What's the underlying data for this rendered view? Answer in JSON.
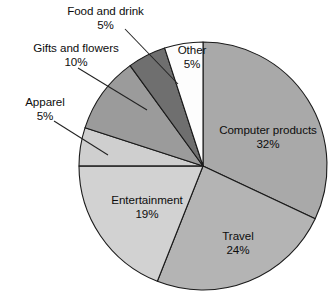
{
  "chart_data": {
    "type": "pie",
    "title": "",
    "subtitle": "",
    "xlabel": "",
    "ylabel": "",
    "legend_position": "none",
    "grid": false,
    "unit": "%",
    "start_angle_deg": 0,
    "direction": "clockwise",
    "categories": [
      "Computer products",
      "Travel",
      "Entertainment",
      "Apparel",
      "Gifts and flowers",
      "Food and drink",
      "Other"
    ],
    "values": [
      32,
      24,
      19,
      5,
      10,
      5,
      5
    ],
    "slices": [
      {
        "label": "Computer products",
        "value": 32,
        "percent_text": "32%",
        "color": "#a9a9a9",
        "start_deg": 0,
        "end_deg": 115.2,
        "label_placement": "inside"
      },
      {
        "label": "Travel",
        "value": 24,
        "percent_text": "24%",
        "color": "#b4b4b4",
        "start_deg": 115.2,
        "end_deg": 201.6,
        "label_placement": "inside"
      },
      {
        "label": "Entertainment",
        "value": 19,
        "percent_text": "19%",
        "color": "#d2d2d2",
        "start_deg": 201.6,
        "end_deg": 270.0,
        "label_placement": "inside"
      },
      {
        "label": "Apparel",
        "value": 5,
        "percent_text": "5%",
        "color": "#cfcfcf",
        "start_deg": 270.0,
        "end_deg": 288.0,
        "label_placement": "callout"
      },
      {
        "label": "Gifts and flowers",
        "value": 10,
        "percent_text": "10%",
        "color": "#9b9b9b",
        "start_deg": 288.0,
        "end_deg": 324.0,
        "label_placement": "callout"
      },
      {
        "label": "Food and drink",
        "value": 5,
        "percent_text": "5%",
        "color": "#6f6f6f",
        "start_deg": 324.0,
        "end_deg": 342.0,
        "label_placement": "callout"
      },
      {
        "label": "Other",
        "value": 5,
        "percent_text": "5%",
        "color": "#fdfdfd",
        "start_deg": 342.0,
        "end_deg": 360.0,
        "label_placement": "inside"
      }
    ],
    "colors": {
      "outline": "#1a1a1a",
      "leader_line": "#222222",
      "text": "#0d0d0d",
      "background": "#ffffff"
    }
  },
  "labels": {
    "food": {
      "name": "Food and drink",
      "percent": "5%"
    },
    "gifts": {
      "name": "Gifts and flowers",
      "percent": "10%"
    },
    "apparel": {
      "name": "Apparel",
      "percent": "5%"
    },
    "other": {
      "name": "Other",
      "percent": "5%"
    },
    "computer": {
      "name": "Computer products",
      "percent": "32%"
    },
    "travel": {
      "name": "Travel",
      "percent": "24%"
    },
    "entertainment": {
      "name": "Entertainment",
      "percent": "19%"
    }
  }
}
